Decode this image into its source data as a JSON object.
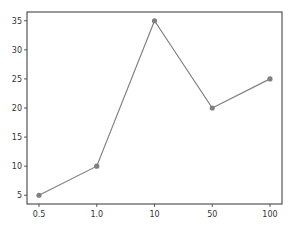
{
  "chart_data": {
    "type": "line",
    "title": "",
    "xlabel": "",
    "ylabel": "",
    "categories": [
      "0.5",
      "1.0",
      "10",
      "50",
      "100"
    ],
    "series": [
      {
        "name": "series",
        "values": [
          5,
          10,
          35,
          20,
          25
        ],
        "color": "#808080",
        "marker": "circle"
      }
    ],
    "yticks": [
      5,
      10,
      15,
      20,
      25,
      30,
      35
    ],
    "ylim": [
      3.5,
      36.5
    ],
    "grid": false,
    "legend": null
  },
  "colors": {
    "line": "#808080",
    "marker": "#808080",
    "axes": "#333333",
    "background": "#ffffff"
  }
}
